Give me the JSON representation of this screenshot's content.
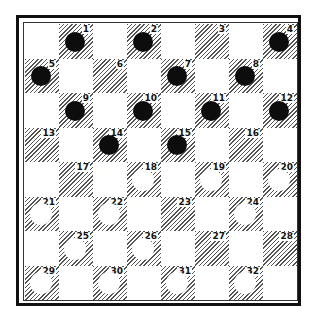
{
  "board": {
    "title": "",
    "size": 8,
    "colors": {
      "dark_square": "#555555",
      "light_square": "#ffffff",
      "black_piece": "#0d0d0d",
      "white_piece": "#ffffff",
      "border": "#111111"
    },
    "squares": [
      {
        "n": "1",
        "row": 0,
        "col": 1,
        "piece": "black"
      },
      {
        "n": "2",
        "row": 0,
        "col": 3,
        "piece": "black"
      },
      {
        "n": "3",
        "row": 0,
        "col": 5,
        "piece": ""
      },
      {
        "n": "4",
        "row": 0,
        "col": 7,
        "piece": "black"
      },
      {
        "n": "5",
        "row": 1,
        "col": 0,
        "piece": "black"
      },
      {
        "n": "6",
        "row": 1,
        "col": 2,
        "piece": ""
      },
      {
        "n": "7",
        "row": 1,
        "col": 4,
        "piece": "black"
      },
      {
        "n": "8",
        "row": 1,
        "col": 6,
        "piece": "black"
      },
      {
        "n": "9",
        "row": 2,
        "col": 1,
        "piece": "black"
      },
      {
        "n": "10",
        "row": 2,
        "col": 3,
        "piece": "black"
      },
      {
        "n": "11",
        "row": 2,
        "col": 5,
        "piece": "black"
      },
      {
        "n": "12",
        "row": 2,
        "col": 7,
        "piece": "black"
      },
      {
        "n": "13",
        "row": 3,
        "col": 0,
        "piece": ""
      },
      {
        "n": "14",
        "row": 3,
        "col": 2,
        "piece": "black"
      },
      {
        "n": "15",
        "row": 3,
        "col": 4,
        "piece": "black"
      },
      {
        "n": "16",
        "row": 3,
        "col": 6,
        "piece": ""
      },
      {
        "n": "17",
        "row": 4,
        "col": 1,
        "piece": ""
      },
      {
        "n": "18",
        "row": 4,
        "col": 3,
        "piece": "white"
      },
      {
        "n": "19",
        "row": 4,
        "col": 5,
        "piece": "white"
      },
      {
        "n": "20",
        "row": 4,
        "col": 7,
        "piece": "white"
      },
      {
        "n": "21",
        "row": 5,
        "col": 0,
        "piece": "white"
      },
      {
        "n": "22",
        "row": 5,
        "col": 2,
        "piece": "white"
      },
      {
        "n": "23",
        "row": 5,
        "col": 4,
        "piece": ""
      },
      {
        "n": "24",
        "row": 5,
        "col": 6,
        "piece": "white"
      },
      {
        "n": "25",
        "row": 6,
        "col": 1,
        "piece": "white"
      },
      {
        "n": "26",
        "row": 6,
        "col": 3,
        "piece": "white"
      },
      {
        "n": "27",
        "row": 6,
        "col": 5,
        "piece": ""
      },
      {
        "n": "28",
        "row": 6,
        "col": 7,
        "piece": ""
      },
      {
        "n": "29",
        "row": 7,
        "col": 0,
        "piece": "white"
      },
      {
        "n": "30",
        "row": 7,
        "col": 2,
        "piece": "white"
      },
      {
        "n": "31",
        "row": 7,
        "col": 4,
        "piece": "white"
      },
      {
        "n": "32",
        "row": 7,
        "col": 6,
        "piece": "white"
      }
    ]
  }
}
